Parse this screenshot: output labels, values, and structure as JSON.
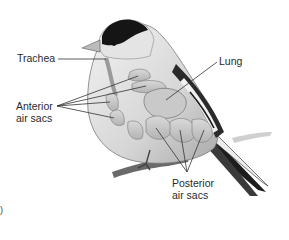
{
  "figure": {
    "style": "grayscale",
    "labels": {
      "trachea": "Trachea",
      "lung": "Lung",
      "anterior_line1": "Anterior",
      "anterior_line2": "air sacs",
      "posterior_line1": "Posterior",
      "posterior_line2": "air sacs"
    },
    "corner_mark": ")"
  },
  "colors": {
    "background": "#ffffff",
    "text": "#2a2a2a",
    "body_light": "#e6e6e6",
    "body_mid": "#bdbdbd",
    "cap": "#151515",
    "leader_lines": "#333333"
  }
}
